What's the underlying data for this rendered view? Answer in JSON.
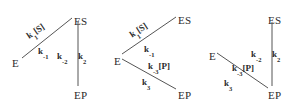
{
  "figure": {
    "type": "kinetic-mechanism-diagrams",
    "background": "#ffffff",
    "line_color": "#555555",
    "text_color": "#2b2b2b"
  },
  "diagrams": [
    {
      "id": "diagram-1",
      "nodes": [
        {
          "name": "E",
          "label": "E",
          "x": 12,
          "y": 58
        },
        {
          "name": "ES",
          "label": "ES",
          "x": 74,
          "y": 16
        },
        {
          "name": "EP",
          "label": "EP",
          "x": 74,
          "y": 90
        }
      ],
      "edges": [
        {
          "name": "e-es",
          "from": "E",
          "to": "ES",
          "labels": [
            {
              "name": "k1S",
              "text": "k₁[S]",
              "base": "k",
              "sub": "1",
              "suffix": "[S]",
              "x": 26,
              "y": 27,
              "rotate": -34
            },
            {
              "name": "kminus1",
              "text": "k₋₁",
              "base": "k",
              "sub": "-1",
              "suffix": "",
              "x": 38,
              "y": 47,
              "rotate": 0
            }
          ]
        },
        {
          "name": "es-ep",
          "from": "ES",
          "to": "EP",
          "labels": [
            {
              "name": "kminus2",
              "text": "k₋₂",
              "base": "k",
              "sub": "-2",
              "suffix": "",
              "x": 57,
              "y": 52,
              "rotate": 0
            },
            {
              "name": "k2",
              "text": "k₂",
              "base": "k",
              "sub": "2",
              "suffix": "",
              "x": 78,
              "y": 52,
              "rotate": 0
            }
          ]
        }
      ]
    },
    {
      "id": "diagram-2",
      "nodes": [
        {
          "name": "E",
          "label": "E",
          "x": 114,
          "y": 56
        },
        {
          "name": "ES",
          "label": "ES",
          "x": 178,
          "y": 15
        },
        {
          "name": "EP",
          "label": "EP",
          "x": 178,
          "y": 90
        }
      ],
      "edges": [
        {
          "name": "e-es",
          "from": "E",
          "to": "ES",
          "labels": [
            {
              "name": "k1S",
              "text": "k₁[S]",
              "base": "k",
              "sub": "1",
              "suffix": "[S]",
              "x": 129,
              "y": 26,
              "rotate": -33
            },
            {
              "name": "kminus1",
              "text": "k₋₁",
              "base": "k",
              "sub": "-1",
              "suffix": "",
              "x": 144,
              "y": 45,
              "rotate": 0
            }
          ]
        },
        {
          "name": "e-ep",
          "from": "E",
          "to": "EP",
          "labels": [
            {
              "name": "kminus3P",
              "text": "k₋₃[P]",
              "base": "k",
              "sub": "-3",
              "suffix": "[P]",
              "x": 148,
              "y": 62,
              "rotate": 0
            },
            {
              "name": "k3",
              "text": "k₃",
              "base": "k",
              "sub": "3",
              "suffix": "",
              "x": 142,
              "y": 78,
              "rotate": 0
            }
          ]
        }
      ]
    },
    {
      "id": "diagram-3",
      "nodes": [
        {
          "name": "E",
          "label": "E",
          "x": 209,
          "y": 51
        },
        {
          "name": "ES",
          "label": "ES",
          "x": 268,
          "y": 15
        },
        {
          "name": "EP",
          "label": "EP",
          "x": 268,
          "y": 90
        }
      ],
      "edges": [
        {
          "name": "es-ep",
          "from": "ES",
          "to": "EP",
          "labels": [
            {
              "name": "kminus2",
              "text": "k₋₂",
              "base": "k",
              "sub": "-2",
              "suffix": "",
              "x": 251,
              "y": 50,
              "rotate": 0
            },
            {
              "name": "k2",
              "text": "k₂",
              "base": "k",
              "sub": "2",
              "suffix": "",
              "x": 272,
              "y": 50,
              "rotate": 0
            }
          ]
        },
        {
          "name": "e-ep",
          "from": "E",
          "to": "EP",
          "labels": [
            {
              "name": "kminus3P",
              "text": "k₋₃[P]",
              "base": "k",
              "sub": "-3",
              "suffix": "[P]",
              "x": 232,
              "y": 64,
              "rotate": 0
            },
            {
              "name": "k3",
              "text": "k₃",
              "base": "k",
              "sub": "3",
              "suffix": "",
              "x": 224,
              "y": 79,
              "rotate": 0
            }
          ]
        }
      ]
    }
  ],
  "lines": [
    {
      "name": "d1-e-es",
      "x1": 22,
      "y1": 58,
      "x2": 72,
      "y2": 18
    },
    {
      "name": "d1-es-ep",
      "x1": 78,
      "y1": 22,
      "x2": 78,
      "y2": 86
    },
    {
      "name": "d2-e-es",
      "x1": 122,
      "y1": 54,
      "x2": 176,
      "y2": 17
    },
    {
      "name": "d2-e-ep",
      "x1": 122,
      "y1": 59,
      "x2": 176,
      "y2": 89
    },
    {
      "name": "d3-es-ep",
      "x1": 272,
      "y1": 22,
      "x2": 272,
      "y2": 86
    },
    {
      "name": "d3-e-ep",
      "x1": 217,
      "y1": 53,
      "x2": 268,
      "y2": 88
    }
  ]
}
